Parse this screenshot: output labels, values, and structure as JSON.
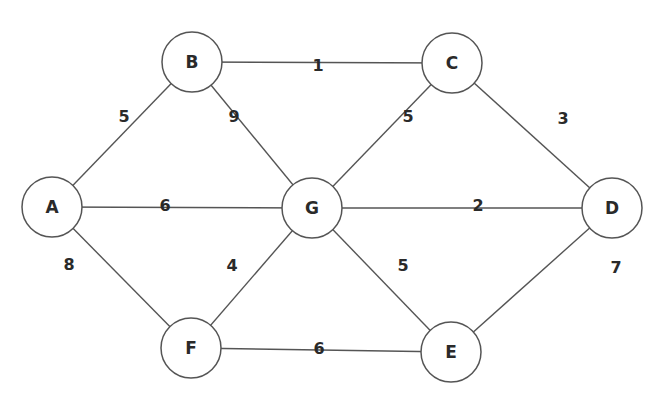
{
  "graph": {
    "type": "weighted-undirected",
    "nodes": [
      {
        "id": "A",
        "x": 52,
        "y": 207
      },
      {
        "id": "B",
        "x": 192,
        "y": 62
      },
      {
        "id": "C",
        "x": 452,
        "y": 63
      },
      {
        "id": "D",
        "x": 612,
        "y": 208
      },
      {
        "id": "E",
        "x": 451,
        "y": 352
      },
      {
        "id": "F",
        "x": 191,
        "y": 348
      },
      {
        "id": "G",
        "x": 312,
        "y": 208
      }
    ],
    "edges": [
      {
        "from": "A",
        "to": "B",
        "weight": "5",
        "lx": 124,
        "ly": 117
      },
      {
        "from": "B",
        "to": "C",
        "weight": "1",
        "lx": 318,
        "ly": 66
      },
      {
        "from": "B",
        "to": "G",
        "weight": "9",
        "lx": 234,
        "ly": 117
      },
      {
        "from": "A",
        "to": "G",
        "weight": "6",
        "lx": 165,
        "ly": 206
      },
      {
        "from": "A",
        "to": "F",
        "weight": "8",
        "lx": 69,
        "ly": 265
      },
      {
        "from": "F",
        "to": "G",
        "weight": "4",
        "lx": 232,
        "ly": 266
      },
      {
        "from": "C",
        "to": "G",
        "weight": "5",
        "lx": 408,
        "ly": 117
      },
      {
        "from": "C",
        "to": "D",
        "weight": "3",
        "lx": 563,
        "ly": 119
      },
      {
        "from": "G",
        "to": "D",
        "weight": "2",
        "lx": 478,
        "ly": 206
      },
      {
        "from": "G",
        "to": "E",
        "weight": "5",
        "lx": 403,
        "ly": 266
      },
      {
        "from": "D",
        "to": "E",
        "weight": "7",
        "lx": 616,
        "ly": 268
      },
      {
        "from": "F",
        "to": "E",
        "weight": "6",
        "lx": 319,
        "ly": 349
      }
    ]
  },
  "style": {
    "node_radius": 30,
    "line_color": "#555555"
  }
}
